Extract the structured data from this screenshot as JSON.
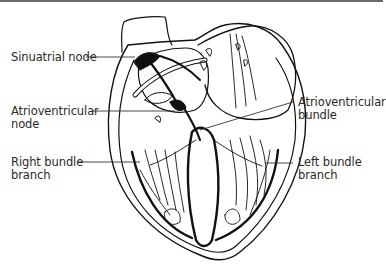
{
  "diagram": {
    "labels": {
      "sinuatrial_node": "Sinuatrial node",
      "av_node_line1": "Atrioventricular",
      "av_node_line2": "node",
      "av_bundle_line1": "Atrioventricular",
      "av_bundle_line2": "bundle",
      "right_branch_line1": "Right bundle",
      "right_branch_line2": "branch",
      "left_branch_line1": "Left bundle",
      "left_branch_line2": "branch"
    },
    "colors": {
      "ink": "#111111",
      "background": "#ffffff",
      "top_rule": "#6a6a6a"
    }
  }
}
